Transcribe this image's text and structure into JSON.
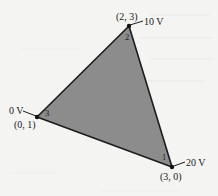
{
  "diagram": {
    "type": "triangular finite element",
    "colors": {
      "background": "#f4f4f2",
      "fill": "#8c8c8c",
      "edge": "#1c1c1c",
      "text": "#1a1a1a"
    },
    "nodes": [
      {
        "id": 1,
        "number_label": "1",
        "coord_label": "(3, 0)",
        "potential_label": "20 V",
        "px": [
          172,
          167
        ]
      },
      {
        "id": 2,
        "number_label": "2",
        "coord_label": "(2, 3)",
        "potential_label": "10 V",
        "px": [
          129,
          26
        ]
      },
      {
        "id": 3,
        "number_label": "3",
        "coord_label": "(0, 1)",
        "potential_label": "0 V",
        "px": [
          37,
          117
        ]
      }
    ]
  }
}
